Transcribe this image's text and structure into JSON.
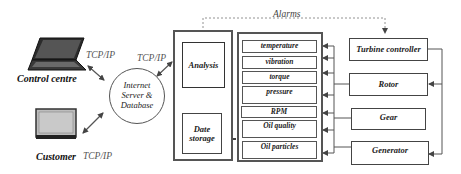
{
  "diagram": {
    "nodes": {
      "control_centre": {
        "label": "Control centre",
        "icon": "laptop-icon"
      },
      "customer": {
        "label": "Customer",
        "icon": "monitor-icon"
      },
      "server": {
        "label_lines": [
          "Internet",
          "Server &",
          "Database"
        ]
      },
      "analysis": {
        "label": "Analysis"
      },
      "data_storage": {
        "label_lines": [
          "Date",
          "storage"
        ]
      },
      "sensors": [
        {
          "label": "temperature"
        },
        {
          "label": "vibration"
        },
        {
          "label": "torque"
        },
        {
          "label": "pressure"
        },
        {
          "label": "RPM"
        },
        {
          "label": "Oil quality"
        },
        {
          "label": "Oil particles"
        }
      ],
      "components": [
        {
          "label": "Turbine controller"
        },
        {
          "label": "Rotor"
        },
        {
          "label": "Gear"
        },
        {
          "label": "Generator"
        }
      ]
    },
    "edge_labels": {
      "control_to_server": "TCP/IP",
      "server_to_system": "TCP/IP",
      "customer_to_server": "TCP/IP",
      "alarms": "Alarms"
    },
    "colors": {
      "line": "#555555",
      "box_border": "#444444",
      "text": "#222222",
      "tcp_text": "#555555"
    }
  }
}
